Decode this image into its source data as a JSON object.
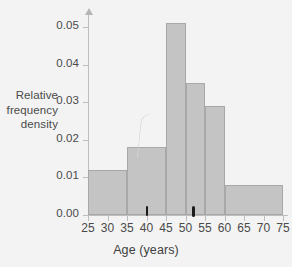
{
  "chart_data": {
    "type": "bar",
    "title": "",
    "xlabel": "Age (years)",
    "ylabel": "Relative frequency density",
    "ylabel_lines": [
      "Relative",
      "frequency",
      "density"
    ],
    "xlim": [
      25,
      75
    ],
    "ylim": [
      0.0,
      0.053
    ],
    "grid": false,
    "legend": null,
    "x_ticks": [
      25,
      30,
      35,
      40,
      45,
      50,
      55,
      60,
      65,
      70,
      75
    ],
    "x_tick_labels": [
      "25",
      "30",
      "35",
      "40",
      "45",
      "50",
      "55",
      "60",
      "65",
      "70",
      "75"
    ],
    "y_ticks": [
      0.0,
      0.01,
      0.02,
      0.03,
      0.04,
      0.05
    ],
    "y_tick_labels": [
      "0.00",
      "0.01",
      "0.02",
      "0.03",
      "0.04",
      "0.05"
    ],
    "bins": [
      {
        "label": "25-35",
        "start": 25,
        "end": 35,
        "value": 0.012
      },
      {
        "label": "35-45",
        "start": 35,
        "end": 45,
        "value": 0.018
      },
      {
        "label": "45-50",
        "start": 45,
        "end": 50,
        "value": 0.051
      },
      {
        "label": "50-55",
        "start": 50,
        "end": 55,
        "value": 0.035
      },
      {
        "label": "55-60",
        "start": 55,
        "end": 60,
        "value": 0.029
      },
      {
        "label": "60-75",
        "start": 60,
        "end": 75,
        "value": 0.008
      }
    ],
    "markers": [
      {
        "name": "marker-1",
        "x": 40.2,
        "style": "thin"
      },
      {
        "name": "marker-2",
        "x": 52.0,
        "style": "thick"
      }
    ],
    "colors": {
      "bar_fill": "#c4c4c4",
      "bar_stroke": "#a8a8a8",
      "axis": "#bdbdbd",
      "text": "#4a4a4a",
      "marker": "#1b1b1b",
      "background": "#f3f3f3"
    }
  }
}
